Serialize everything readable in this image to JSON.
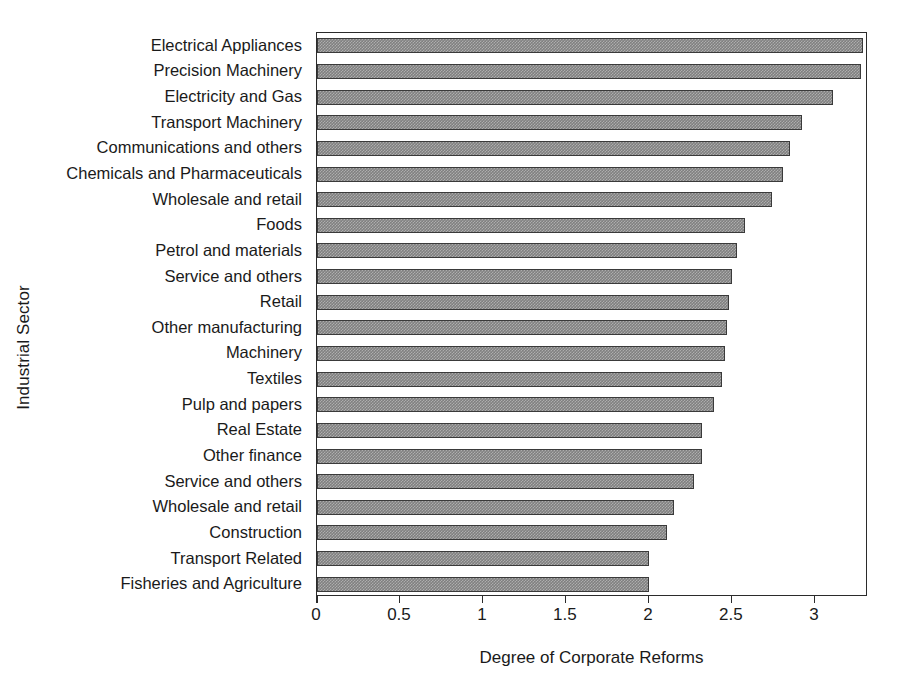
{
  "chart_data": {
    "type": "bar",
    "orientation": "horizontal",
    "title": "",
    "xlabel": "Degree of Corporate Reforms",
    "ylabel": "Industrial Sector",
    "xlim": [
      0,
      3.32
    ],
    "xticks": [
      "0",
      "0.5",
      "1",
      "1.5",
      "2",
      "2.5",
      "3"
    ],
    "xtick_values": [
      0,
      0.5,
      1,
      1.5,
      2,
      2.5,
      3
    ],
    "grid": false,
    "legend": null,
    "bar_color": "#808080",
    "bar_edge_color": "#3a3a3a",
    "bar_pattern": "fine-checker-hatch",
    "axis_color": "#2b2b2b",
    "categories": [
      "Electrical Appliances",
      "Precision Machinery",
      "Electricity and Gas",
      "Transport Machinery",
      "Communications and others",
      "Chemicals and Pharmaceuticals",
      "Wholesale and retail",
      "Foods",
      "Petrol and materials",
      "Service and others",
      "Retail",
      "Other manufacturing",
      "Machinery",
      "Textiles",
      "Pulp and papers",
      "Real Estate",
      "Other finance",
      "Service and others",
      "Wholesale and retail",
      "Construction",
      "Transport Related",
      "Fisheries and Agriculture"
    ],
    "values": [
      3.29,
      3.28,
      3.11,
      2.92,
      2.85,
      2.81,
      2.74,
      2.58,
      2.53,
      2.5,
      2.48,
      2.47,
      2.46,
      2.44,
      2.39,
      2.32,
      2.32,
      2.27,
      2.15,
      2.11,
      2.0,
      2.0
    ]
  }
}
